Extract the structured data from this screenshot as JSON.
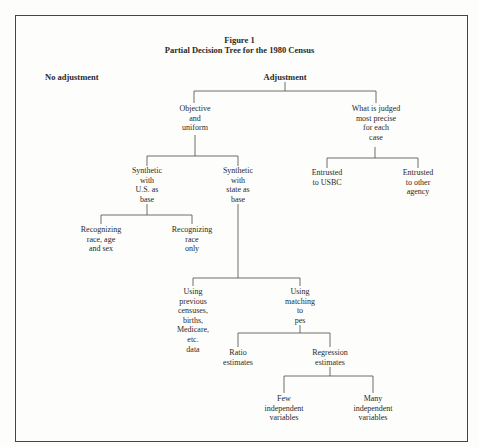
{
  "figure": {
    "label": "Figure 1",
    "title": "Partial Decision Tree for the 1980 Census"
  },
  "root_options": {
    "no_adjustment": "No adjustment",
    "adjustment": "Adjustment"
  },
  "nodes": {
    "objective": "Objective\nand\nuniform",
    "judged": "What is judged\nmost precise\nfor each\ncase",
    "synthetic_us": "Synthetic\nwith\nU.S. as\nbase",
    "synthetic_state": "Synthetic\nwith\nstate as\nbase",
    "entrusted_usbc": "Entrusted\nto USBC",
    "entrusted_other": "Entrusted\nto other\nagency",
    "race_age_sex": "Recognizing\nrace, age\nand sex",
    "race_only": "Recognizing\nrace\nonly",
    "previous_censuses": "Using\nprevious\ncensuses,\nbirths,\nMedicare,\netc.\ndata",
    "matching_pes": "Using\nmatching\nto\npes",
    "ratio": "Ratio\nestimates",
    "regression": "Regression\nestimates",
    "few_vars": "Few\nindependent\nvariables",
    "many_vars": "Many\nindependent\nvariables"
  },
  "tree": {
    "Adjustment": {
      "Objective and uniform": {
        "Synthetic with U.S. as base": [
          "Recognizing race, age and sex",
          "Recognizing race only"
        ],
        "Synthetic with state as base": {
          "Using previous censuses, births, Medicare, etc. data": [],
          "Using matching to pes": {
            "Ratio estimates": [],
            "Regression estimates": [
              "Few independent variables",
              "Many independent variables"
            ]
          }
        }
      },
      "What is judged most precise for each case": [
        "Entrusted to USBC",
        "Entrusted to other agency"
      ]
    },
    "No adjustment": []
  }
}
